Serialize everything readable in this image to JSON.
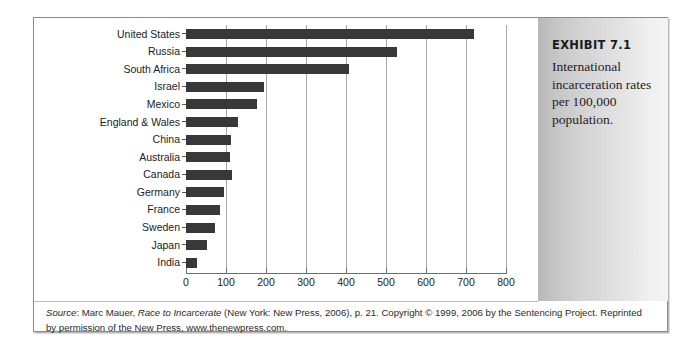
{
  "exhibit": {
    "title": "EXHIBIT 7.1",
    "caption": "International incarceration rates per 100,000 population."
  },
  "source_note": {
    "source_word": "Source",
    "line1_a": ": Marc Mauer, ",
    "italic_title": "Race to Incarcerate",
    "line1_b": " (New York: New Press, 2006), p. 21. Copyright © 1999, 2006 by the",
    "line2": "Sentencing Project. Reprinted by permission of the New Press, www.thenewpress.com."
  },
  "colors": {
    "bar": "#383838",
    "gridline": "#a7a7a7",
    "axis": "#6f6f6f",
    "panel_light": "#f4f4f4",
    "panel_dark": "#b7b7b7",
    "frame": "#8a8a8a"
  },
  "chart_data": {
    "type": "bar",
    "orientation": "horizontal",
    "title": "International incarceration rates per 100,000 population",
    "xlabel": "",
    "ylabel": "",
    "xlim": [
      0,
      800
    ],
    "xticks": [
      0,
      100,
      200,
      300,
      400,
      500,
      600,
      700,
      800
    ],
    "grid": true,
    "legend": false,
    "categories": [
      "United States",
      "Russia",
      "South Africa",
      "Israel",
      "Mexico",
      "England & Wales",
      "China",
      "Australia",
      "Canada",
      "Germany",
      "France",
      "Sweden",
      "Japan",
      "India"
    ],
    "values": [
      720,
      528,
      408,
      196,
      178,
      130,
      113,
      110,
      115,
      95,
      85,
      73,
      52,
      27
    ],
    "units": "per 100,000 population"
  }
}
